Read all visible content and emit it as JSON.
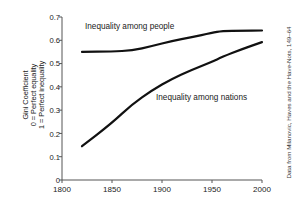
{
  "chart_data": {
    "type": "line",
    "title": "",
    "xlabel": "",
    "ylabel_lines": [
      "Gini Coefficient",
      "0 = Perfect equality",
      "1 = Perfect inequality"
    ],
    "xlim": [
      1800,
      2000
    ],
    "ylim": [
      0,
      0.7
    ],
    "grid": false,
    "legend_position": "inline-annotations",
    "xticks": [
      1800,
      1850,
      1900,
      1950,
      2000
    ],
    "xtick_labels": [
      "1800",
      "1850",
      "1900",
      "1950",
      "2000"
    ],
    "yticks": [
      0,
      0.1,
      0.2,
      0.3,
      0.4,
      0.5,
      0.6,
      0.7
    ],
    "ytick_labels": [
      "0",
      "0.1",
      "0.2",
      "0.3",
      "0.4",
      "0.5",
      "0.6",
      "0.7"
    ],
    "series": [
      {
        "name": "Inequality among people",
        "color": "#111111",
        "x": [
          1820,
          1850,
          1870,
          1890,
          1910,
          1929,
          1950,
          1960,
          1980,
          2000
        ],
        "values": [
          0.55,
          0.552,
          0.556,
          0.575,
          0.597,
          0.613,
          0.632,
          0.64,
          0.641,
          0.642
        ]
      },
      {
        "name": "Inequality among nations",
        "color": "#111111",
        "x": [
          1820,
          1850,
          1870,
          1890,
          1910,
          1929,
          1950,
          1960,
          1980,
          2000
        ],
        "values": [
          0.145,
          0.245,
          0.325,
          0.385,
          0.435,
          0.472,
          0.508,
          0.528,
          0.562,
          0.592
        ]
      }
    ],
    "annotations": [
      {
        "text": "Inequality among people",
        "x": 1838,
        "y": 0.655
      },
      {
        "text": "Inequality among nations",
        "x": 1905,
        "y": 0.368
      }
    ],
    "source_credit": "Data from Milanovic, Haves and the Have-Nots, 149–64",
    "axis_color": "#555555",
    "text_color": "#1a1a1a"
  }
}
